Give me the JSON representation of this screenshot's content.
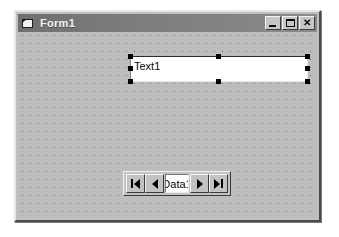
{
  "window": {
    "title": "Form1",
    "icon": "form-document-icon",
    "buttons": [
      {
        "name": "minimize",
        "label": "_",
        "glyph": "minimize-icon"
      },
      {
        "name": "maximize",
        "label": "□",
        "glyph": "maximize-icon"
      },
      {
        "name": "close",
        "label": "✕",
        "glyph": "close-icon"
      }
    ]
  },
  "designer": {
    "grid": "dot-grid",
    "background_color": "#bdbdbd"
  },
  "controls": {
    "textbox": {
      "name": "Text1",
      "value": "Text1",
      "selected": true,
      "handle_count": 8
    },
    "data_control": {
      "caption": "Data1",
      "buttons": [
        {
          "name": "move-first",
          "glyph": "first-record-icon"
        },
        {
          "name": "move-previous",
          "glyph": "previous-record-icon"
        },
        {
          "name": "move-next",
          "glyph": "next-record-icon"
        },
        {
          "name": "move-last",
          "glyph": "last-record-icon"
        }
      ]
    }
  }
}
